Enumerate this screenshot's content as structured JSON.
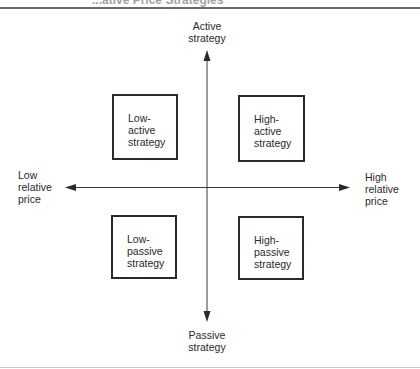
{
  "figure": {
    "title_fragment": "...ative Price Strategies"
  },
  "axes": {
    "top_label": "Active\nstrategy",
    "bottom_label": "Passive\nstrategy",
    "left_label": "Low\nrelative\nprice",
    "right_label": "High\nrelative\nprice"
  },
  "quadrants": [
    {
      "id": "low-active",
      "label": "Low-\nactive\nstrategy"
    },
    {
      "id": "high-active",
      "label": "High-\nactive\nstrategy"
    },
    {
      "id": "low-passive",
      "label": "Low-\npassive\nstrategy"
    },
    {
      "id": "high-passive",
      "label": "High-\npassive\nstrategy"
    }
  ],
  "colors": {
    "line": "#2a2a2a",
    "rule_top": "#6a6a6a",
    "rule_bottom": "#c8c8c8",
    "background": "#ffffff"
  }
}
